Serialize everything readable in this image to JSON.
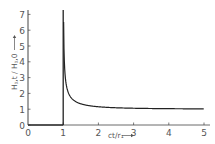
{
  "chart_data": {
    "type": "line",
    "title": "",
    "xlabel": "ct/r₁",
    "ylabel": "H_{φ,t}/H_{φ,0}",
    "xlim": [
      0,
      5
    ],
    "ylim": [
      0,
      7
    ],
    "x_ticks": [
      "0",
      "1",
      "2",
      "3",
      "4",
      "5"
    ],
    "y_ticks": [
      "0",
      "1",
      "2",
      "3",
      "4",
      "5",
      "6",
      "7"
    ],
    "grid": false,
    "legend": null,
    "series": [
      {
        "name": "H_{φ,t}/H_{φ,0}",
        "x": [
          0,
          1,
          1,
          1.02,
          1.05,
          1.1,
          1.2,
          1.3,
          1.5,
          1.75,
          2,
          2.5,
          3,
          3.5,
          4,
          4.5,
          5
        ],
        "y": [
          0,
          0,
          7,
          5.0,
          3.2,
          2.4,
          1.81,
          1.56,
          1.34,
          1.22,
          1.15,
          1.09,
          1.06,
          1.04,
          1.03,
          1.03,
          1.02
        ]
      }
    ],
    "annotations": [
      "vertical asymptote at ct/r₁ = 1",
      "curve approaches 1 as ct/r₁ increases"
    ]
  },
  "labels": {
    "x_axis": "ct/r₁",
    "y_axis": "Hᵪ,t / Hᵪ,0",
    "x_ticks": [
      "0",
      "1",
      "2",
      "3",
      "4",
      "5"
    ],
    "y_ticks": [
      "0",
      "1",
      "2",
      "3",
      "4",
      "5",
      "6",
      "7"
    ]
  }
}
